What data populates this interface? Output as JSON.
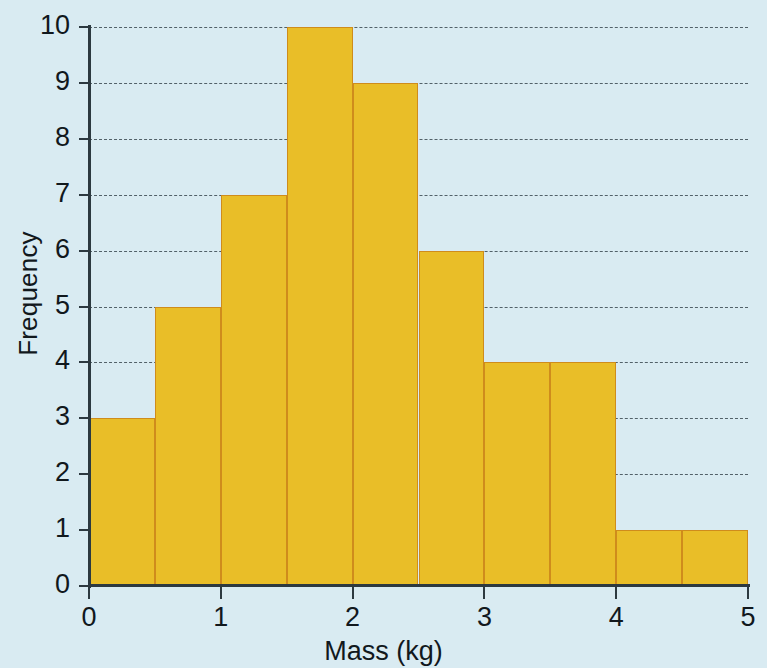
{
  "chart_data": {
    "type": "bar",
    "title": "",
    "subtitle": "",
    "xlabel": "Mass (kg)",
    "ylabel": "Frequency",
    "xlim": [
      0,
      5
    ],
    "ylim": [
      0,
      10
    ],
    "grid": true,
    "legend": null,
    "bin_width": 0.5,
    "bin_edges": [
      0,
      0.5,
      1,
      1.5,
      2,
      2.5,
      3,
      3.5,
      4,
      4.5,
      5
    ],
    "categories": [
      "0-0.5",
      "0.5-1",
      "1-1.5",
      "1.5-2",
      "2-2.5",
      "2.5-3",
      "3-3.5",
      "3.5-4",
      "4-4.5",
      "4.5-5"
    ],
    "values": [
      3,
      5,
      7,
      10,
      9,
      6,
      4,
      4,
      1,
      1
    ],
    "xticks": [
      0,
      1,
      2,
      3,
      4,
      5
    ],
    "xtick_labels": [
      "0",
      "1",
      "2",
      "3",
      "4",
      "5"
    ],
    "yticks": [
      0,
      1,
      2,
      3,
      4,
      5,
      6,
      7,
      8,
      9,
      10
    ],
    "ytick_labels": [
      "0",
      "1",
      "2",
      "3",
      "4",
      "5",
      "6",
      "7",
      "8",
      "9",
      "10"
    ],
    "colors": {
      "bar_fill": "#e9be28",
      "bar_edge": "#cf8c1c",
      "background": "#d9ebf2",
      "axis": "#2c3940",
      "grid": "#3b4a52",
      "text": "#11181d"
    }
  }
}
